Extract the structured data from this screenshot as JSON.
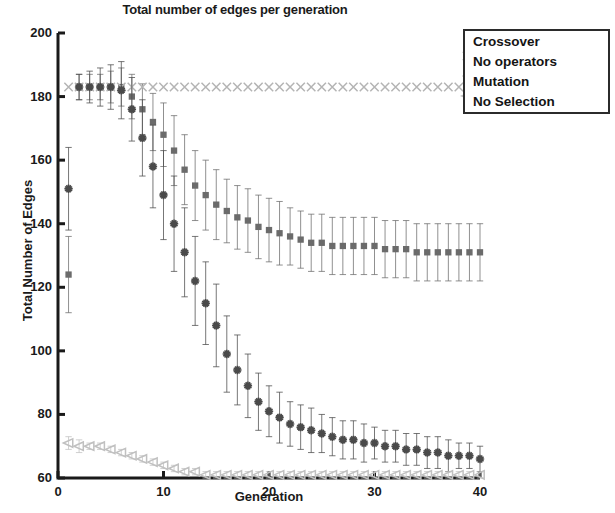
{
  "chart_data": {
    "type": "scatter",
    "title": "Total number of edges per generation",
    "xlabel": "Generation",
    "ylabel": "Total Number of Edges",
    "xlim": [
      0,
      40
    ],
    "ylim": [
      60,
      200
    ],
    "xticks": [
      0,
      10,
      20,
      30,
      40
    ],
    "yticks": [
      60,
      80,
      100,
      120,
      140,
      160,
      180,
      200
    ],
    "grid": false,
    "errorbars": true,
    "legend_position": "top-right-outside",
    "x": [
      1,
      2,
      3,
      4,
      5,
      6,
      7,
      8,
      9,
      10,
      11,
      12,
      13,
      14,
      15,
      16,
      17,
      18,
      19,
      20,
      21,
      22,
      23,
      24,
      25,
      26,
      27,
      28,
      29,
      30,
      31,
      32,
      33,
      34,
      35,
      36,
      37,
      38,
      39,
      40
    ],
    "series": [
      {
        "name": "Crossover",
        "marker": "square",
        "color": "#6b6b6b",
        "values": [
          124,
          183,
          183,
          183,
          183,
          183,
          180,
          176,
          172,
          168,
          163,
          157,
          152,
          149,
          146,
          144,
          142,
          141,
          139,
          138,
          137,
          136,
          135,
          134,
          134,
          133,
          133,
          133,
          133,
          133,
          132,
          132,
          132,
          131,
          131,
          131,
          131,
          131,
          131,
          131
        ],
        "errors": [
          12,
          4,
          4,
          4,
          5,
          6,
          7,
          8,
          9,
          10,
          11,
          11,
          11,
          11,
          11,
          10,
          10,
          10,
          10,
          10,
          10,
          9,
          9,
          9,
          9,
          9,
          9,
          9,
          9,
          9,
          9,
          9,
          9,
          9,
          9,
          9,
          9,
          9,
          9,
          9
        ]
      },
      {
        "name": "No operators",
        "marker": "x",
        "color": "#b4b4b4",
        "values": [
          183,
          183,
          183,
          183,
          183,
          183,
          183,
          183,
          183,
          183,
          183,
          183,
          183,
          183,
          183,
          183,
          183,
          183,
          183,
          183,
          183,
          183,
          183,
          183,
          183,
          183,
          183,
          183,
          183,
          183,
          183,
          183,
          183,
          183,
          183,
          183,
          183,
          183,
          183,
          183
        ],
        "errors": [
          0,
          0,
          0,
          0,
          0,
          0,
          0,
          0,
          0,
          0,
          0,
          0,
          0,
          0,
          0,
          0,
          0,
          0,
          0,
          0,
          0,
          0,
          0,
          0,
          0,
          0,
          0,
          0,
          0,
          0,
          0,
          0,
          0,
          0,
          0,
          0,
          0,
          0,
          0,
          0
        ]
      },
      {
        "name": "Mutation",
        "marker": "star",
        "color": "#4a4a4a",
        "values": [
          151,
          183,
          183,
          183,
          183,
          182,
          176,
          167,
          158,
          149,
          140,
          131,
          122,
          115,
          108,
          99,
          94,
          89,
          84,
          81,
          79,
          77,
          76,
          75,
          74,
          73,
          72,
          72,
          71,
          71,
          70,
          70,
          69,
          69,
          68,
          68,
          67,
          67,
          67,
          66
        ],
        "errors": [
          13,
          4,
          5,
          6,
          7,
          9,
          10,
          12,
          13,
          14,
          15,
          14,
          14,
          13,
          13,
          12,
          11,
          10,
          9,
          8,
          8,
          7,
          7,
          7,
          6,
          6,
          6,
          6,
          6,
          5,
          5,
          5,
          5,
          5,
          5,
          5,
          5,
          4,
          4,
          4
        ]
      },
      {
        "name": "No Selection",
        "marker": "triangle-left",
        "color": "#c0c0c0",
        "values": [
          71,
          70,
          70,
          70,
          69,
          68,
          67,
          66,
          65,
          64,
          63,
          62,
          62,
          61,
          61,
          61,
          61,
          61,
          61,
          61,
          61,
          61,
          61,
          61,
          61,
          61,
          61,
          61,
          61,
          61,
          61,
          61,
          61,
          61,
          61,
          61,
          61,
          61,
          61,
          61
        ],
        "errors": [
          2,
          2,
          1,
          1,
          1,
          1,
          1,
          1,
          1,
          1,
          1,
          1,
          1,
          1,
          1,
          1,
          1,
          1,
          1,
          1,
          1,
          1,
          1,
          1,
          1,
          1,
          1,
          1,
          1,
          1,
          1,
          1,
          1,
          1,
          1,
          1,
          1,
          1,
          1,
          1
        ]
      }
    ]
  },
  "legend": {
    "items": [
      {
        "label": "Crossover"
      },
      {
        "label": "No operators"
      },
      {
        "label": "Mutation"
      },
      {
        "label": "No Selection"
      }
    ]
  }
}
